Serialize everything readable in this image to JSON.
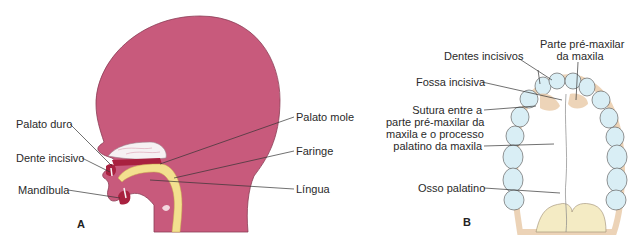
{
  "colors": {
    "tissue": "#c85a7c",
    "tissue_outline": "#8a3d55",
    "pharynx": "#f3e08f",
    "palate_white": "#f6f1f3",
    "tooth_dark": "#a8213f",
    "tooth_fill": "#d9eef5",
    "bone_tan": "#e8c9a6",
    "label_line": "#333333"
  },
  "panel_a": {
    "letter": "A",
    "labels": {
      "palato_duro": "Palato duro",
      "dente_incisivo": "Dente incisivo",
      "mandibula": "Mandíbula",
      "palato_mole": "Palato mole",
      "faringe": "Faringe",
      "lingua": "Língua"
    }
  },
  "panel_b": {
    "letter": "B",
    "labels": {
      "dentes_incisivos": "Dentes incisivos",
      "parte_premaxilar_l1": "Parte pré-maxilar",
      "parte_premaxilar_l2": "da maxila",
      "fossa_incisiva": "Fossa incisiva",
      "sutura_l1": "Sutura entre a",
      "sutura_l2": "parte pré-maxilar da",
      "sutura_l3": "maxila e o processo",
      "sutura_l4": "palatino da maxila",
      "osso_palatino": "Osso palatino"
    }
  }
}
